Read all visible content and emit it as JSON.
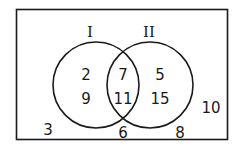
{
  "diagram": {
    "type": "venn",
    "sets": [
      {
        "label": "I"
      },
      {
        "label": "II"
      }
    ],
    "regions": {
      "only_I": [
        "2",
        "9"
      ],
      "intersection": [
        "7",
        "11"
      ],
      "only_II": [
        "5",
        "15"
      ],
      "outside": [
        "3",
        "6",
        "8",
        "10"
      ]
    },
    "colors": {
      "stroke": "#1a1a1a",
      "background": "#ffffff"
    }
  }
}
